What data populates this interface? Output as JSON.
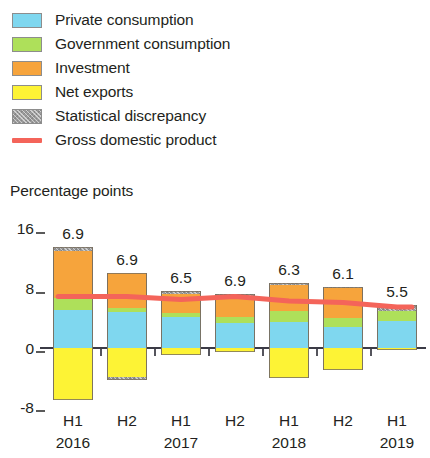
{
  "legend": {
    "items": [
      {
        "label": "Private consumption",
        "color": "#7fd7ef",
        "marker": "swatch",
        "icon": "legend-swatch-icon"
      },
      {
        "label": "Government consumption",
        "color": "#aee05a",
        "marker": "swatch",
        "icon": "legend-swatch-icon"
      },
      {
        "label": "Investment",
        "color": "#f6a43c",
        "marker": "swatch",
        "icon": "legend-swatch-icon"
      },
      {
        "label": "Net exports",
        "color": "#fdf335",
        "marker": "swatch",
        "icon": "legend-swatch-icon"
      },
      {
        "label": "Statistical discrepancy",
        "color": "#9a9a9a",
        "marker": "swatch-hatch",
        "icon": "legend-swatch-icon"
      },
      {
        "label": "Gross domestic product",
        "color": "#f4645a",
        "marker": "line",
        "icon": "legend-line-icon"
      }
    ]
  },
  "axis": {
    "title": "Percentage points",
    "y_ticks": [
      "16",
      "8",
      "0",
      "-8"
    ],
    "x_periods": [
      "H1",
      "H2",
      "H1",
      "H2",
      "H1",
      "H2",
      "H1"
    ],
    "x_years": [
      "2016",
      "",
      "2017",
      "",
      "2018",
      "",
      "2019"
    ]
  },
  "chart_data": {
    "type": "bar",
    "title": "",
    "subtitle": "",
    "xlabel": "",
    "ylabel": "Percentage points",
    "ylim": [
      -8,
      16
    ],
    "yticks": [
      -8,
      0,
      8,
      16
    ],
    "grid": false,
    "stacked": true,
    "legend_position": "top-left",
    "categories": [
      "H1 2016",
      "H2 2016",
      "H1 2017",
      "H2 2017",
      "H1 2018",
      "H2 2018",
      "H1 2019"
    ],
    "category_periods": [
      "H1",
      "H2",
      "H1",
      "H2",
      "H1",
      "H2",
      "H1"
    ],
    "category_years": [
      "2016",
      "2016",
      "2017",
      "2017",
      "2018",
      "2018",
      "2019"
    ],
    "series": [
      {
        "name": "Private consumption",
        "color": "#7fd7ef",
        "values": [
          5.1,
          4.8,
          4.2,
          3.4,
          3.5,
          2.8,
          3.6
        ]
      },
      {
        "name": "Government consumption",
        "color": "#aee05a",
        "values": [
          1.6,
          0.5,
          0.5,
          0.8,
          1.4,
          1.2,
          1.4
        ]
      },
      {
        "name": "Investment",
        "color": "#f6a43c",
        "values": [
          6.3,
          4.7,
          2.6,
          2.8,
          3.5,
          4.0,
          0.0
        ]
      },
      {
        "name": "Net exports",
        "color": "#fdf335",
        "values": [
          -7.0,
          -3.9,
          -0.9,
          -0.5,
          -4.0,
          -2.9,
          -0.3
        ]
      },
      {
        "name": "Statistical discrepancy",
        "color": "#9a9a9a",
        "values": [
          0.6,
          -0.4,
          0.4,
          0.2,
          0.3,
          0.2,
          0.7
        ]
      }
    ],
    "gdp_line": {
      "name": "Gross domestic product",
      "color": "#f4645a",
      "values": [
        6.9,
        6.9,
        6.5,
        6.9,
        6.3,
        6.1,
        5.5
      ]
    },
    "value_labels": [
      "6.9",
      "6.9",
      "6.5",
      "6.9",
      "6.3",
      "6.1",
      "5.5"
    ]
  }
}
